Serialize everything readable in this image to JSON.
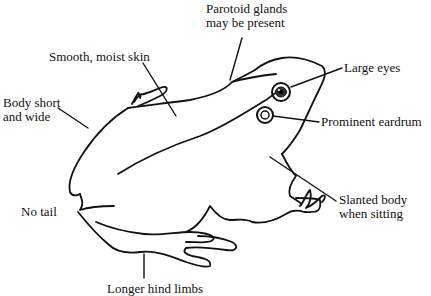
{
  "diagram": {
    "stroke_color": "#111111",
    "background": "#ffffff",
    "labels": [
      {
        "id": "parotoid",
        "line1": "Parotoid glands",
        "line2": "may be present"
      },
      {
        "id": "skin",
        "line1": "Smooth, moist skin"
      },
      {
        "id": "eyes",
        "line1": "Large eyes"
      },
      {
        "id": "body",
        "line1": "Body short",
        "line2": "and wide"
      },
      {
        "id": "eardrum",
        "line1": "Prominent eardrum"
      },
      {
        "id": "slanted",
        "line1": "Slanted body",
        "line2": "when sitting"
      },
      {
        "id": "tail",
        "line1": "No tail"
      },
      {
        "id": "hindlimbs",
        "line1": "Longer hind limbs"
      }
    ]
  }
}
